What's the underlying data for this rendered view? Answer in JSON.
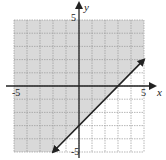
{
  "chart_data": {
    "type": "line",
    "title": "",
    "xlabel": "x",
    "ylabel": "y",
    "xlim": [
      -5,
      5
    ],
    "ylim": [
      -5,
      5
    ],
    "grid": true,
    "tick_labels": {
      "x": [
        "-5",
        "5"
      ],
      "y": [
        "5",
        "-5"
      ]
    },
    "series": [
      {
        "name": "boundary line y = x - 3",
        "equation": "y = x - 3",
        "line_style": "solid",
        "arrows": "both",
        "points": [
          [
            -2,
            -5
          ],
          [
            5,
            2
          ]
        ]
      }
    ],
    "shaded_region": {
      "description": "above the line (y >= x - 3)",
      "inequality": "y >= x - 3",
      "color": "#d9d9d9"
    }
  }
}
